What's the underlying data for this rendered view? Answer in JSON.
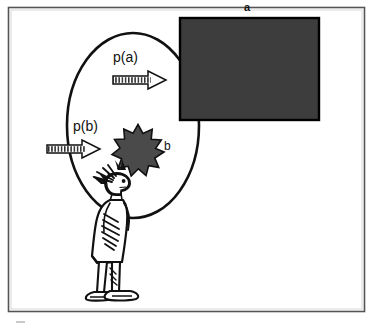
{
  "figure": {
    "title_visible": false,
    "background_color": "#ffffff",
    "frame": {
      "name": "outer-frame-border",
      "color": "#4d4d4d",
      "x": 8,
      "y": 7,
      "width": 357,
      "height": 305
    },
    "labels": {
      "outcome_a": "a",
      "outcome_b": "b",
      "probability_a": "p(a)",
      "probability_b": "p(b)"
    },
    "shapes": {
      "ellipse": {
        "name": "decision-field-ellipse",
        "stroke_color": "#111111",
        "fill": "none",
        "cx": 133,
        "cy": 125,
        "rx": 66,
        "ry": 92
      },
      "rectangle": {
        "name": "outcome-a-rectangle",
        "fill_color": "#3d3d3d",
        "stroke_color": "#000000",
        "x": 180,
        "y": 18,
        "width": 139,
        "height": 102
      },
      "starburst": {
        "name": "outcome-b-starburst",
        "fill_color": "#4a4a4a",
        "stroke_color": "#000000",
        "cx": 140,
        "cy": 152,
        "outer_radius": 24,
        "inner_radius": 14,
        "points": 12
      },
      "arrow_a": {
        "name": "probability-a-arrow",
        "style": "hatched-block-arrow",
        "fill_color": "#ffffff",
        "stroke_color": "#111111",
        "x": 113,
        "y": 71,
        "width": 53,
        "height": 18,
        "direction": "right"
      },
      "arrow_b": {
        "name": "probability-b-arrow",
        "style": "hatched-block-arrow",
        "fill_color": "#ffffff",
        "stroke_color": "#111111",
        "x": 47,
        "y": 140,
        "width": 53,
        "height": 18,
        "direction": "right"
      },
      "person": {
        "name": "observer-person-sketch",
        "stroke_color": "#111111",
        "description": "hand-drawn standing figure facing right"
      }
    }
  }
}
